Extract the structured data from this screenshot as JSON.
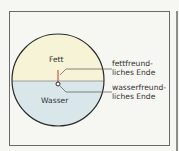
{
  "diagram": {
    "regions": {
      "top": "Fett",
      "bottom": "Wasser"
    },
    "annotations": [
      {
        "line1": "fettfreund-",
        "line2": "liches Ende"
      },
      {
        "line1": "wasserfreund-",
        "line2": "liches Ende"
      }
    ],
    "colors": {
      "fat": "#f7f3d6",
      "water": "#d9e7ea",
      "outline": "#2b2b2b",
      "hydrophobic_tail": "#d9534f",
      "frame": "#6a6a6a",
      "background": "#f6f6f2"
    }
  }
}
